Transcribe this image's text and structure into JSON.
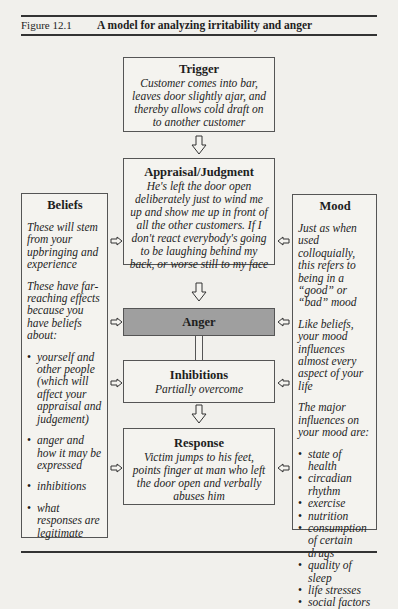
{
  "figure": {
    "number": "Figure 12.1",
    "title": "A model for analyzing irritability and anger"
  },
  "flow": {
    "trigger": {
      "heading": "Trigger",
      "text": "Customer comes into bar, leaves door slightly ajar, and thereby allows cold draft on to another customer"
    },
    "appraisal": {
      "heading": "Appraisal/Judgment",
      "text": "He's left the door open deliberately just to wind me up and show me up in front of all the other customers. If I don't react everybody's going to be laughing behind my back, or worse still to my face"
    },
    "anger": {
      "heading": "Anger"
    },
    "inhibitions": {
      "heading": "Inhibitions",
      "text": "Partially overcome"
    },
    "response": {
      "heading": "Response",
      "text": "Victim jumps to his feet, points finger at man who left the door open and verbally abuses him"
    }
  },
  "beliefs": {
    "heading": "Beliefs",
    "para1": "These will stem from your upbringing and experience",
    "para2": "These have far-reaching effects because you have beliefs about:",
    "items": [
      "yourself and other people (which will affect your appraisal and judgement)",
      "anger and how it may be expressed",
      "inhibitions",
      "what responses are legitimate"
    ]
  },
  "mood": {
    "heading": "Mood",
    "para1": "Just as when used colloquially, this refers to being in a “good” or “bad” mood",
    "para2": "Like beliefs, your mood influences almost every aspect of your life",
    "para3": "The major influences on your mood are:",
    "items": [
      "state of health",
      "circadian rhythm",
      "exercise",
      "nutrition",
      "consumption of certain drugs",
      "quality of sleep",
      "life stresses",
      "social factors"
    ]
  },
  "icons": {
    "down_arrow": "hollow-down-arrow",
    "right_arrow": "hollow-right-arrow",
    "left_arrow": "hollow-left-arrow"
  },
  "colors": {
    "background": "#f1f0ec",
    "anger_fill": "#9f9f9f",
    "border": "#555555"
  }
}
